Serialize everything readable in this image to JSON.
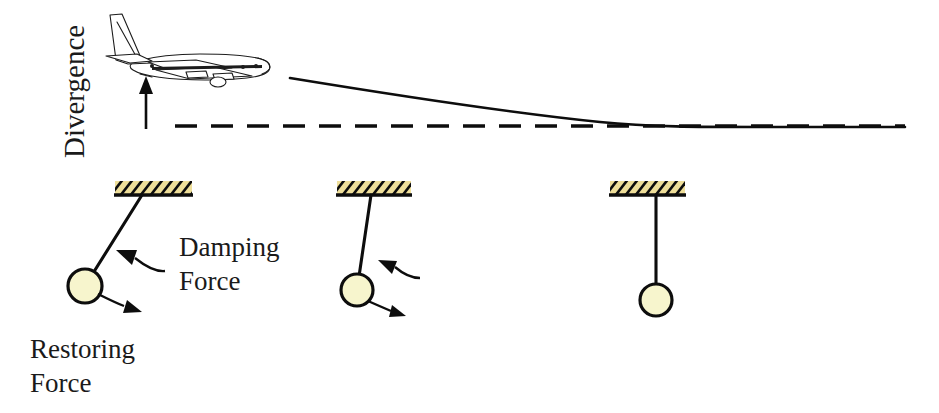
{
  "figure": {
    "type": "physics-concept-diagram",
    "width": 939,
    "height": 413,
    "background_color": "#ffffff"
  },
  "labels": {
    "axis_vertical": "Divergence",
    "damping_force_line1": "Damping",
    "damping_force_line2": "Force",
    "restoring_force_line1": "Restoring",
    "restoring_force_line2": "Force"
  },
  "colors": {
    "ink": "#0d0d0d",
    "text": "#1a1a1a",
    "support_fill": "#efdf9a",
    "bob_fill": "#f7f5cd",
    "background": "#ffffff"
  },
  "upper_panel": {
    "aircraft": {
      "icon": "airliner-side-view-icon",
      "heading": "right",
      "bbox": {
        "x": 106,
        "y": 12,
        "width": 166,
        "height": 70
      }
    },
    "lift_arrow": {
      "icon": "up-arrow-icon",
      "x": 146,
      "y_tail": 129,
      "y_head": 76
    },
    "divergence_curve": {
      "description": "solid decaying curve approaching the equilibrium line asymptotically",
      "start": {
        "x": 290,
        "y": 78
      },
      "end": {
        "x": 905,
        "y": 127
      },
      "merge_point_x": 648
    },
    "equilibrium_line": {
      "style": "dashed",
      "y": 126,
      "x_start": 175,
      "x_end": 905,
      "dash_length": 22,
      "gap_length": 14
    }
  },
  "pendulums": [
    {
      "name": "pendulum-large-amplitude",
      "support": {
        "x": 115,
        "y": 181,
        "width": 77,
        "height": 14
      },
      "pivot": {
        "x": 142,
        "y": 196
      },
      "bob": {
        "cx": 85,
        "cy": 286,
        "r": 17
      },
      "angle_label": "large deflection",
      "damping_arrow": {
        "from": {
          "x": 152,
          "y": 268
        },
        "to": {
          "x": 116,
          "y": 252
        }
      },
      "restoring_arrow": {
        "from": {
          "x": 98,
          "y": 295
        },
        "to": {
          "x": 137,
          "y": 307
        }
      },
      "has_damping_label": true,
      "has_restoring_label": true
    },
    {
      "name": "pendulum-medium-amplitude",
      "support": {
        "x": 337,
        "y": 181,
        "width": 74,
        "height": 14
      },
      "pivot": {
        "x": 371,
        "y": 196
      },
      "bob": {
        "cx": 357,
        "cy": 290,
        "r": 16
      },
      "angle_label": "small deflection",
      "damping_arrow": {
        "from": {
          "x": 412,
          "y": 274
        },
        "to": {
          "x": 378,
          "y": 261
        }
      },
      "restoring_arrow": {
        "from": {
          "x": 368,
          "y": 302
        },
        "to": {
          "x": 400,
          "y": 313
        }
      },
      "has_damping_label": false,
      "has_restoring_label": false
    },
    {
      "name": "pendulum-at-rest",
      "support": {
        "x": 610,
        "y": 181,
        "width": 75,
        "height": 14
      },
      "pivot": {
        "x": 656,
        "y": 196
      },
      "bob": {
        "cx": 656,
        "cy": 300,
        "r": 16
      },
      "angle_label": "no deflection",
      "damping_arrow": null,
      "restoring_arrow": null,
      "has_damping_label": false,
      "has_restoring_label": false
    }
  ]
}
